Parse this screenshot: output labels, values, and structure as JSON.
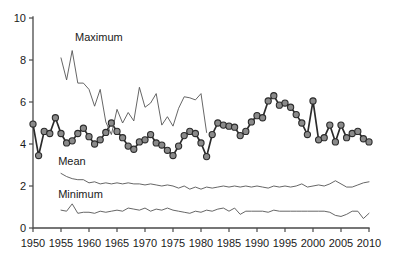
{
  "chart_data": {
    "type": "line",
    "title": "",
    "xlabel": "",
    "ylabel": "",
    "xlim": [
      1950,
      2010
    ],
    "ylim": [
      0,
      10
    ],
    "xticks": [
      1950,
      1955,
      1960,
      1965,
      1970,
      1975,
      1980,
      1985,
      1990,
      1995,
      2000,
      2005,
      2010
    ],
    "yticks": [
      0,
      2,
      4,
      6,
      8,
      10
    ],
    "grid": false,
    "legend": "inline-annotations",
    "annotations": [
      {
        "text": "Maximum",
        "x": 1957.5,
        "y": 8.9
      },
      {
        "text": "Mean",
        "x": 1954.5,
        "y": 3.0
      },
      {
        "text": "Minimum",
        "x": 1954.5,
        "y": 1.45
      }
    ],
    "series": [
      {
        "name": "Annual series (markers)",
        "style": "thick-line-with-circle-markers",
        "markers": true,
        "x": [
          1950,
          1951,
          1952,
          1953,
          1954,
          1955,
          1956,
          1957,
          1958,
          1959,
          1960,
          1961,
          1962,
          1963,
          1964,
          1965,
          1966,
          1967,
          1968,
          1969,
          1970,
          1971,
          1972,
          1973,
          1974,
          1975,
          1976,
          1977,
          1978,
          1979,
          1980,
          1981,
          1982,
          1983,
          1984,
          1985,
          1986,
          1987,
          1988,
          1989,
          1990,
          1991,
          1992,
          1993,
          1994,
          1995,
          1996,
          1997,
          1998,
          1999,
          2000,
          2001,
          2002,
          2003,
          2004,
          2005,
          2006,
          2007,
          2008,
          2009,
          2010
        ],
        "values": [
          4.95,
          3.45,
          4.6,
          4.5,
          5.25,
          4.5,
          4.05,
          4.15,
          4.5,
          4.75,
          4.35,
          4.0,
          4.2,
          4.55,
          5.0,
          4.6,
          4.3,
          3.9,
          3.75,
          4.1,
          4.2,
          4.45,
          4.05,
          3.95,
          3.7,
          3.45,
          3.9,
          4.4,
          4.6,
          4.5,
          4.05,
          3.4,
          4.45,
          5.0,
          4.9,
          4.85,
          4.8,
          4.4,
          4.6,
          5.05,
          5.35,
          5.25,
          6.05,
          6.3,
          5.85,
          5.95,
          5.75,
          5.4,
          5.0,
          4.45,
          6.05,
          4.2,
          4.3,
          4.9,
          4.1,
          4.9,
          4.3,
          4.5,
          4.6,
          4.25,
          4.1
        ]
      },
      {
        "name": "Maximum",
        "style": "thin-line",
        "markers": false,
        "x": [
          1955,
          1956,
          1957,
          1958,
          1959,
          1960,
          1961,
          1962,
          1963,
          1964,
          1965,
          1966,
          1967,
          1968,
          1969,
          1970,
          1971,
          1972,
          1973,
          1974,
          1975,
          1976,
          1977,
          1978,
          1979,
          1980,
          1981
        ],
        "values": [
          8.1,
          7.05,
          8.45,
          6.9,
          6.9,
          6.6,
          5.8,
          6.6,
          5.05,
          4.45,
          5.65,
          5.0,
          5.5,
          5.1,
          6.7,
          5.75,
          5.95,
          6.4,
          4.9,
          5.3,
          4.85,
          5.7,
          6.25,
          6.2,
          6.1,
          6.4,
          4.55
        ]
      },
      {
        "name": "Mean",
        "style": "thin-line",
        "markers": false,
        "x": [
          1955,
          1956,
          1957,
          1958,
          1959,
          1960,
          1961,
          1962,
          1963,
          1964,
          1965,
          1966,
          1967,
          1968,
          1969,
          1970,
          1971,
          1972,
          1973,
          1974,
          1975,
          1976,
          1977,
          1978,
          1979,
          1980,
          1981,
          1982,
          1983,
          1984,
          1985,
          1986,
          1987,
          1988,
          1989,
          1990,
          1991,
          1992,
          1993,
          1994,
          1995,
          1996,
          1997,
          1998,
          1999,
          2000,
          2001,
          2002,
          2003,
          2004,
          2005,
          2006,
          2007,
          2008,
          2009,
          2010
        ],
        "values": [
          2.6,
          2.45,
          2.35,
          2.3,
          2.3,
          2.15,
          2.2,
          2.1,
          2.15,
          2.1,
          2.15,
          2.1,
          2.15,
          2.1,
          2.1,
          2.05,
          2.1,
          2.05,
          2.0,
          2.05,
          2.0,
          1.9,
          2.0,
          1.85,
          1.95,
          1.85,
          1.95,
          1.9,
          1.95,
          2.0,
          1.95,
          2.0,
          1.95,
          2.0,
          1.95,
          2.0,
          1.95,
          1.9,
          2.0,
          1.95,
          2.0,
          1.95,
          2.0,
          2.1,
          1.95,
          2.0,
          2.05,
          2.0,
          2.1,
          2.25,
          2.1,
          1.95,
          1.95,
          2.05,
          2.15,
          2.2
        ]
      },
      {
        "name": "Minimum",
        "style": "thin-line",
        "markers": false,
        "x": [
          1955,
          1956,
          1957,
          1958,
          1959,
          1960,
          1961,
          1962,
          1963,
          1964,
          1965,
          1966,
          1967,
          1968,
          1969,
          1970,
          1971,
          1972,
          1973,
          1974,
          1975,
          1976,
          1977,
          1978,
          1979,
          1980,
          1981,
          1982,
          1983,
          1984,
          1985,
          1986,
          1987,
          1988,
          1989,
          1990,
          1991,
          1992,
          1993,
          1994,
          1995,
          1996,
          1997,
          1998,
          1999,
          2000,
          2001,
          2002,
          2003,
          2004,
          2005,
          2006,
          2007,
          2008,
          2009,
          2010
        ],
        "values": [
          0.85,
          0.8,
          1.15,
          0.7,
          0.75,
          0.75,
          0.7,
          0.8,
          0.75,
          0.8,
          0.85,
          0.8,
          0.95,
          0.9,
          0.85,
          0.95,
          0.8,
          0.9,
          0.85,
          0.95,
          0.85,
          0.8,
          0.75,
          0.7,
          0.8,
          0.75,
          0.85,
          0.8,
          0.9,
          0.95,
          0.8,
          0.95,
          0.65,
          0.8,
          0.8,
          0.8,
          0.8,
          0.75,
          0.85,
          0.8,
          0.8,
          0.8,
          0.8,
          0.8,
          0.8,
          0.8,
          0.8,
          0.8,
          0.75,
          0.6,
          0.55,
          0.65,
          0.8,
          0.8,
          0.45,
          0.7
        ]
      }
    ]
  },
  "axes": {
    "y_tick_labels": [
      "0",
      "2",
      "4",
      "6",
      "8",
      "10"
    ],
    "x_tick_labels": [
      "1950",
      "1955",
      "1960",
      "1965",
      "1970",
      "1975",
      "1980",
      "1985",
      "1990",
      "1995",
      "2000",
      "2005",
      "2010"
    ]
  },
  "labels": {
    "maximum": "Maximum",
    "mean": "Mean",
    "minimum": "Minimum"
  },
  "colors": {
    "axis": "#4a4a4a",
    "thick_series": "#2b2b2b",
    "thin_series": "#555555",
    "marker_fill": "#8a8a8a",
    "background": "#ffffff"
  }
}
